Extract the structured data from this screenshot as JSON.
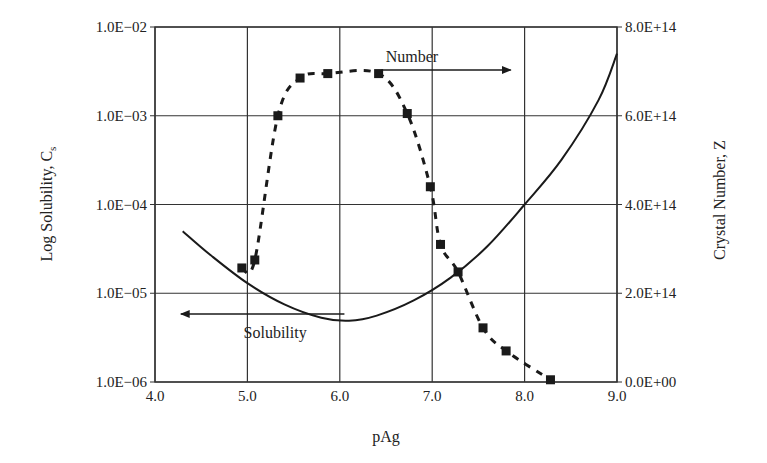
{
  "chart_data": {
    "type": "line",
    "title": "",
    "xlabel": "pAg",
    "ylabel": "Log Solubility, Cs",
    "ylabel_right": "Crystal Number, Z",
    "xlim": [
      4.0,
      9.0
    ],
    "ylim": [
      1e-06,
      0.01
    ],
    "ylim_right": [
      0,
      800000000000000.0
    ],
    "yscale": "log",
    "grid": true,
    "x_ticks": [
      "4.0",
      "5.0",
      "6.0",
      "7.0",
      "8.0",
      "9.0"
    ],
    "y_ticks_left": [
      "1.0E−06",
      "1.0E−05",
      "1.0E−04",
      "1.0E−03",
      "1.0E−02"
    ],
    "y_ticks_right": [
      "0.0E+00",
      "2.0E+14",
      "4.0E+14",
      "6.0E+14",
      "8.0E+14"
    ],
    "annotations": [
      {
        "text": "Number",
        "arrow": "right",
        "x": 6.6,
        "y_right": 700000000000000.0
      },
      {
        "text": "Solubility",
        "arrow": "left",
        "x": 4.9,
        "y_left": 7e-06
      }
    ],
    "series": [
      {
        "name": "Solubility",
        "axis": "left",
        "style": "solid",
        "x": [
          4.3,
          4.6,
          5.0,
          5.4,
          5.8,
          6.1,
          6.4,
          6.8,
          7.2,
          7.6,
          8.0,
          8.4,
          8.8,
          9.0
        ],
        "values": [
          5e-05,
          2.7e-05,
          1.3e-05,
          7.5e-06,
          5.3e-06,
          4.9e-06,
          5.6e-06,
          8.3e-06,
          1.5e-05,
          3.4e-05,
          0.0001,
          0.00032,
          0.0015,
          0.005
        ]
      },
      {
        "name": "Number",
        "axis": "right",
        "style": "dashed",
        "marker": "square",
        "x": [
          4.94,
          5.08,
          5.33,
          5.57,
          5.87,
          6.42,
          6.73,
          6.98,
          7.09,
          7.28,
          7.55,
          7.8,
          8.28
        ],
        "values": [
          257000000000000.0,
          275000000000000.0,
          600000000000000.0,
          685000000000000.0,
          695000000000000.0,
          695000000000000.0,
          605000000000000.0,
          440000000000000.0,
          310000000000000.0,
          248000000000000.0,
          122000000000000.0,
          70000000000000.0,
          5000000000000.0
        ]
      }
    ]
  },
  "labels": {
    "x_axis": "pAg",
    "y_left_main": "Log Solubility, C",
    "y_left_sub": "s",
    "y_right": "Crystal Number, Z",
    "number_annot": "Number",
    "solubility_annot": "Solubility"
  },
  "colors": {
    "line": "#1a1a1a",
    "grid": "#333333",
    "background": "#ffffff"
  }
}
